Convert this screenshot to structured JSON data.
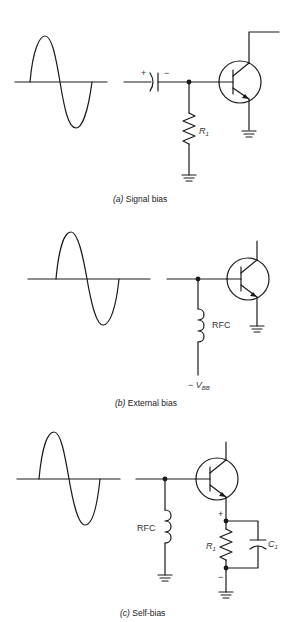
{
  "figure": {
    "panels": [
      {
        "id": "a",
        "caption_tag": "(a)",
        "caption_text": "Signal bias",
        "components": {
          "coupling_capacitor": {
            "plus": "+",
            "minus": "−"
          },
          "resistor": {
            "label": "R",
            "subscript": "1"
          },
          "grounds": 2,
          "transistor": "NPN"
        }
      },
      {
        "id": "b",
        "caption_tag": "(b)",
        "caption_text": "External bias",
        "components": {
          "inductor": {
            "label": "RFC"
          },
          "supply": {
            "prefix": "− ",
            "label": "V",
            "subscript": "BB"
          },
          "grounds": 1,
          "transistor": "NPN"
        }
      },
      {
        "id": "c",
        "caption_tag": "(c)",
        "caption_text": "Self-bias",
        "components": {
          "inductor": {
            "label": "RFC"
          },
          "resistor": {
            "label": "R",
            "subscript": "1"
          },
          "capacitor": {
            "label": "C",
            "subscript": "1"
          },
          "polarity": {
            "plus": "+",
            "minus": "−"
          },
          "grounds": 2,
          "transistor": "NPN"
        }
      }
    ]
  }
}
